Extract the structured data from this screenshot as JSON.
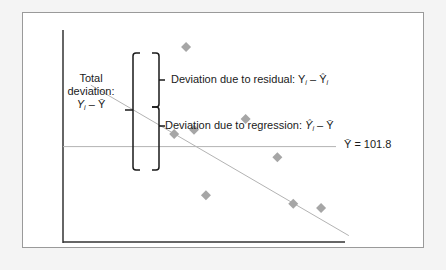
{
  "labels": {
    "total_line1": "Total",
    "total_line2": "deviation:",
    "total_formula_Y": "Y",
    "total_formula_sub": "i",
    "total_formula_rest": " – Ȳ",
    "residual_text": "Deviation due to residual: ",
    "residual_Y": "Y",
    "residual_sub": "i",
    "residual_rest": " – Ŷ",
    "residual_sub2": "i",
    "regression_text": "Deviation due to regression: ",
    "regression_Y": "Ŷ",
    "regression_sub": "i",
    "regression_rest": " – Ȳ",
    "mean_label": "Ȳ = 101.8"
  },
  "colors": {
    "points": "#a6a6a6",
    "regression_line": "#b3b3b3",
    "mean_line": "#b3b3b3",
    "axes": "#333333",
    "brackets": "#1a1a1a"
  },
  "chart_data": {
    "type": "scatter",
    "title": "",
    "xlabel": "",
    "ylabel": "",
    "mean_y": 101.8,
    "points": [
      {
        "x": 0.31,
        "y": 0.92
      },
      {
        "x": 0.28,
        "y": 0.51
      },
      {
        "x": 0.33,
        "y": 0.53
      },
      {
        "x": 0.46,
        "y": 0.58
      },
      {
        "x": 0.54,
        "y": 0.4
      },
      {
        "x": 0.36,
        "y": 0.22
      },
      {
        "x": 0.58,
        "y": 0.18
      },
      {
        "x": 0.65,
        "y": 0.16
      }
    ],
    "regression_line": {
      "x0": 0.07,
      "y0": 0.74,
      "x1": 0.72,
      "y1": 0.03
    },
    "mean_line_level": 0.45,
    "xlim": [
      0,
      1
    ],
    "ylim": [
      0,
      1
    ]
  }
}
